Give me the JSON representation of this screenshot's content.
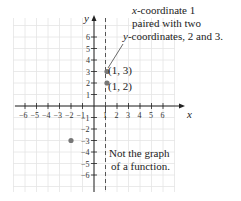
{
  "chart_data": {
    "type": "scatter",
    "title": "",
    "xlabel": "x",
    "ylabel": "y",
    "xlim": [
      -6,
      6
    ],
    "ylim": [
      -6,
      6
    ],
    "grid": true,
    "x_ticks": [
      "-6",
      "-5",
      "-4",
      "-3",
      "-2",
      "-1",
      "1",
      "2",
      "3",
      "4",
      "5",
      "6"
    ],
    "y_ticks": [
      "6",
      "5",
      "4",
      "3",
      "2",
      "1",
      "-1",
      "-2",
      "-3",
      "-4",
      "-5",
      "-6"
    ],
    "points": [
      {
        "x": 1,
        "y": 3,
        "label": "(1, 3)"
      },
      {
        "x": 1,
        "y": 2,
        "label": "(1, 2)"
      },
      {
        "x": -2,
        "y": -3,
        "label": ""
      }
    ],
    "vertical_line": {
      "x": 1,
      "style": "dashed"
    },
    "annotations": [
      {
        "text_lines": [
          "x-coordinate 1",
          "paired with two",
          "y-coordinates, 2 and 3."
        ],
        "points_to": "(1, 3)"
      },
      {
        "text_lines": [
          "Not the graph",
          "of a function."
        ]
      }
    ]
  },
  "labels": {
    "x_axis": "x",
    "y_axis": "y",
    "p13": "(1, 3)",
    "p12": "(1, 2)",
    "note1_l1": "x-coordinate 1",
    "note1_l2": "paired with two",
    "note1_l3": "y-coordinates, 2 and 3.",
    "note2_l1": "Not the graph",
    "note2_l2": "of a function."
  },
  "colors": {
    "grid": "#e4e4e4",
    "axis": "#222222",
    "point": "#777777",
    "text": "#222222"
  }
}
